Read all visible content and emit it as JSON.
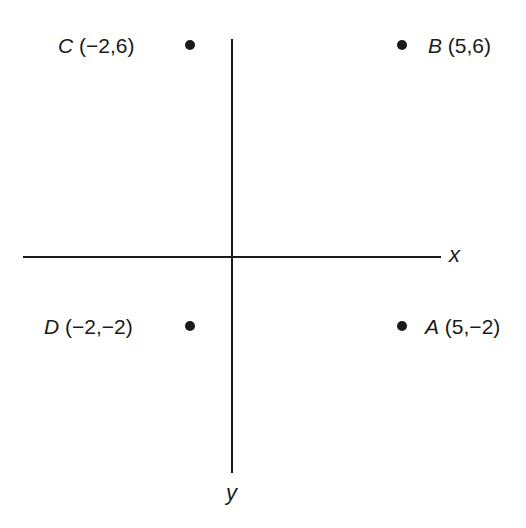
{
  "diagram": {
    "type": "coordinate-plane",
    "axes": {
      "x_label": "x",
      "y_label": "y"
    },
    "points": [
      {
        "name": "C",
        "coords": "(−2,6)",
        "x": -2,
        "y": 6
      },
      {
        "name": "B",
        "coords": "(5,6)",
        "x": 5,
        "y": 6
      },
      {
        "name": "D",
        "coords": "(−2,−2)",
        "x": -2,
        "y": -2
      },
      {
        "name": "A",
        "coords": "(5,−2)",
        "x": 5,
        "y": -2
      }
    ],
    "colors": {
      "ink": "#1a1a1a",
      "background": "#ffffff"
    }
  }
}
